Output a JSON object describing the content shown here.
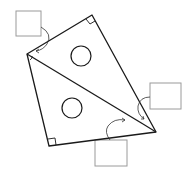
{
  "diagram": {
    "colors": {
      "stroke": "#1a1a1a",
      "box_stroke": "#9a9a9a",
      "background": "#ffffff"
    },
    "vertices": {
      "left": [
        27,
        54
      ],
      "top": [
        92,
        15
      ],
      "bottom_left": [
        49,
        146
      ],
      "tip": [
        156,
        132
      ],
      "diag_end": [
        143,
        124
      ]
    },
    "circles": [
      {
        "cx": 81,
        "cy": 56,
        "r": 10
      },
      {
        "cx": 72,
        "cy": 108,
        "r": 10
      }
    ],
    "label_boxes": [
      {
        "name": "top-left-box",
        "x": 16,
        "y": 11,
        "w": 25,
        "h": 25,
        "text": ""
      },
      {
        "name": "right-box",
        "x": 150,
        "y": 83,
        "w": 31,
        "h": 26,
        "text": ""
      },
      {
        "name": "bottom-box",
        "x": 95,
        "y": 140,
        "w": 32,
        "h": 26,
        "text": ""
      }
    ]
  }
}
